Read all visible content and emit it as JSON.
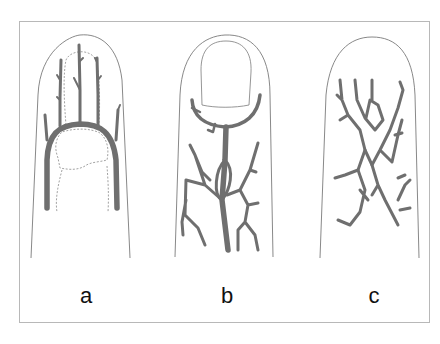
{
  "figure": {
    "panels": [
      {
        "id": "a",
        "label": "a",
        "description": "Fingertip with arch-shaped vessel and three upward branches; dashed outline of distal phalanx"
      },
      {
        "id": "b",
        "label": "b",
        "description": "Fingertip with nail plate; vessel arch beneath nail with branching network below"
      },
      {
        "id": "c",
        "label": "c",
        "description": "Fingertip with irregular reticular branching vessel network"
      }
    ],
    "colors": {
      "vessel": "#6f6f6f",
      "outline": "#7a7a7a",
      "frame": "#b8b8b8",
      "background": "#ffffff"
    }
  }
}
